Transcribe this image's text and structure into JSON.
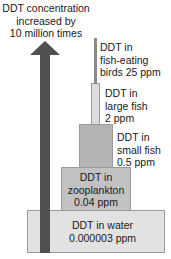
{
  "arrow_label": {
    "line1": "DDT concentration",
    "line2": "increased by",
    "line3": "10 million times"
  },
  "levels": [
    {
      "name": "birds",
      "line1": "DDT in",
      "line2": "fish-eating",
      "line3": "birds 25 ppm",
      "color": "#8a8a8a"
    },
    {
      "name": "large_fish",
      "line1": "DDT in",
      "line2": "large fish",
      "line3": "2 ppm",
      "color": "#dcdcdc"
    },
    {
      "name": "small_fish",
      "line1": "DDT in",
      "line2": "small fish",
      "line3": "0.5 ppm",
      "color": "#b4b4b4"
    },
    {
      "name": "zooplankton",
      "line1": "DDT in",
      "line2": "zooplankton",
      "line3": "0.04 ppm",
      "color": "#c2c2c2"
    },
    {
      "name": "water",
      "line1": "DDT in water",
      "line2": "0.000003 ppm",
      "color": "#e2e2e2"
    }
  ],
  "colors": {
    "arrow": "#505050"
  }
}
